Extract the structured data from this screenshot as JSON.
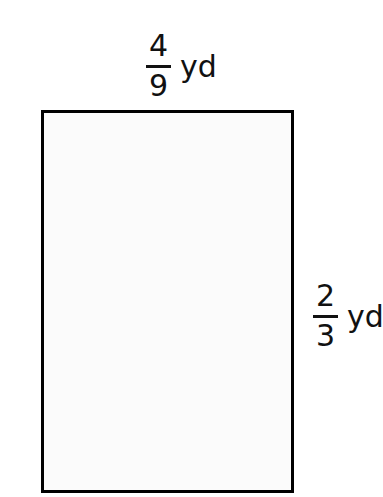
{
  "figure": {
    "type": "rectangle-dimension-diagram",
    "background_color": "#ffffff",
    "shape": {
      "name": "rectangle",
      "fill_color": "#fbfbfb",
      "stroke_color": "#000000",
      "stroke_width_px": 3
    },
    "labels": {
      "width": {
        "numerator": "4",
        "denominator": "9",
        "unit": "yd",
        "position": "top"
      },
      "height": {
        "numerator": "2",
        "denominator": "3",
        "unit": "yd",
        "position": "right"
      }
    },
    "watermark": {
      "top_text": "",
      "bottom_text": "",
      "color": "#fafafa"
    }
  }
}
